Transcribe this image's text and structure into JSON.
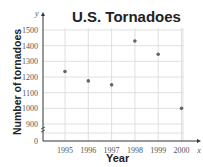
{
  "chart_data": {
    "type": "scatter",
    "title": "U.S. Tornadoes",
    "xlabel": "Year",
    "ylabel": "Number of tornadoes",
    "x_axis_symbol": "x",
    "y_axis_symbol": "y",
    "x": [
      1995,
      1996,
      1997,
      1998,
      1999,
      2000
    ],
    "values": [
      1235,
      1175,
      1150,
      1430,
      1345,
      1000
    ],
    "x_ticks": [
      "1995",
      "1996",
      "1997",
      "1998",
      "1999",
      "2000"
    ],
    "y_ticks": [
      "0",
      "900",
      "1000",
      "1100",
      "1200",
      "1300",
      "1400",
      "1500"
    ],
    "ylim": [
      0,
      1500
    ],
    "axis_break": true,
    "grid": true,
    "legend": null
  },
  "labels": {
    "title": "U.S. Tornadoes",
    "xlabel": "Year",
    "ylabel": "Number of tornadoes"
  }
}
